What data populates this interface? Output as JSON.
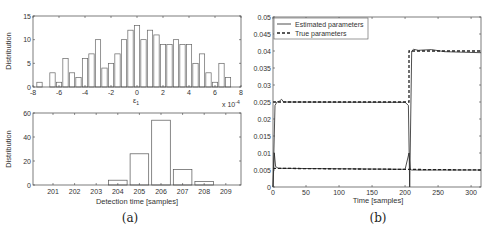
{
  "chart_data": [
    {
      "type": "bar",
      "panel": "top-left",
      "title": "",
      "xlabel": "ε1",
      "ylabel": "Distribution",
      "x_multiplier": "x 10^-4",
      "xlim": [
        -8,
        8
      ],
      "ylim": [
        0,
        15
      ],
      "xticks": [
        "-8",
        "-6",
        "-4",
        "-2",
        "0",
        "2",
        "4",
        "6",
        "8"
      ],
      "yticks": [
        "0",
        "5",
        "10",
        "15"
      ],
      "x": [
        -7.5,
        -6.5,
        -6,
        -5.5,
        -5,
        -4.5,
        -4,
        -3.5,
        -3,
        -2.5,
        -2,
        -1.5,
        -1,
        -0.5,
        0,
        0.5,
        1,
        1.5,
        2,
        2.5,
        3,
        3.5,
        4,
        4.5,
        5,
        5.5,
        6,
        6.5,
        7
      ],
      "values": [
        1,
        3,
        1,
        6,
        3,
        2,
        6,
        7,
        10,
        4,
        5,
        7,
        10,
        12,
        13,
        10,
        12,
        11,
        9,
        9,
        10,
        9,
        9,
        5,
        7,
        3,
        1,
        5,
        2
      ],
      "grid": false
    },
    {
      "type": "bar",
      "panel": "bottom-left",
      "xlabel": "Detection time [samples]",
      "ylabel": "Distribution",
      "ylim": [
        0,
        60
      ],
      "yticks": [
        "0",
        "20",
        "40",
        "60"
      ],
      "categories": [
        "201",
        "202",
        "203",
        "204",
        "205",
        "206",
        "207",
        "208",
        "209"
      ],
      "values": [
        0,
        0,
        0,
        4,
        26,
        54,
        13,
        3,
        0
      ],
      "grid": false
    },
    {
      "type": "line",
      "panel": "right",
      "xlabel": "Time [samples]",
      "ylabel": "",
      "xlim": [
        0,
        315
      ],
      "ylim": [
        0,
        0.05
      ],
      "xticks": [
        "0",
        "50",
        "100",
        "150",
        "200",
        "250",
        "300"
      ],
      "yticks": [
        "0",
        "0.005",
        "0.01",
        "0.015",
        "0.02",
        "0.025",
        "0.03",
        "0.035",
        "0.04",
        "0.045",
        "0.05"
      ],
      "legend": [
        "Estimated parameters",
        "True parameters"
      ],
      "legend_position": "upper left",
      "series": [
        {
          "name": "True parameters (upper)",
          "style": "dashed",
          "x": [
            0,
            206,
            206,
            315
          ],
          "values": [
            0.025,
            0.025,
            0.04,
            0.04
          ]
        },
        {
          "name": "True parameters (lower)",
          "style": "dashed",
          "x": [
            0,
            315
          ],
          "values": [
            0.0055,
            0.005
          ]
        },
        {
          "name": "Estimated parameters (upper)",
          "style": "solid",
          "x": [
            0,
            3,
            6,
            10,
            13,
            16,
            200,
            205,
            207,
            210,
            213,
            220,
            240,
            260,
            315
          ],
          "values": [
            0,
            0.024,
            0.025,
            0.0253,
            0.0258,
            0.025,
            0.0249,
            0.024,
            0,
            0.04,
            0.0405,
            0.0402,
            0.0404,
            0.0398,
            0.0395
          ]
        },
        {
          "name": "Estimated parameters (lower)",
          "style": "solid",
          "x": [
            0,
            2,
            4,
            8,
            200,
            206,
            208,
            210,
            315
          ],
          "values": [
            0,
            0.01,
            0.006,
            0.0055,
            0.0052,
            0.01,
            0.0052,
            0.005,
            0.005
          ]
        }
      ],
      "grid": false
    }
  ],
  "captions": {
    "a": "(a)",
    "b": "(b)"
  },
  "labels": {
    "tl_ylabel": "Distribution",
    "tl_xlabel": "ε",
    "tl_xlabel_sub": "1",
    "tl_multiplier": "x 10",
    "tl_multiplier_exp": "-4",
    "bl_ylabel": "Distribution",
    "bl_xlabel": "Detection time [samples]",
    "r_xlabel": "Time [samples]",
    "legend_est": "Estimated parameters",
    "legend_true": "True parameters"
  }
}
